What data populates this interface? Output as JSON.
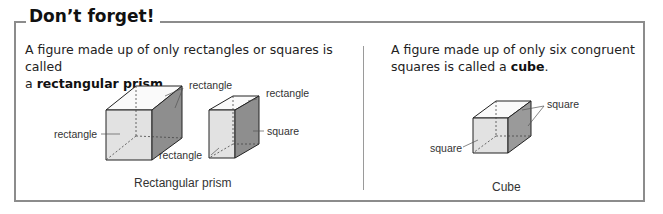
{
  "box": {
    "title": "Don’t forget!"
  },
  "left_panel": {
    "text_before": "A figure made up of only rectangles or squares is called",
    "text_line2_prefix": "a ",
    "term": "rectangular prism",
    "text_suffix": ".",
    "labels": {
      "large_top": "rectangle",
      "large_front": "rectangle",
      "small_top": "rectangle",
      "small_side": "square",
      "small_front": "rectangle"
    },
    "caption": "Rectangular prism"
  },
  "right_panel": {
    "text_line1": "A figure made up of only six congruent",
    "text_line2_prefix": "squares is called a ",
    "term": "cube",
    "text_suffix": ".",
    "labels": {
      "top_side": "square",
      "front": "square"
    },
    "caption": "Cube"
  },
  "colors": {
    "border": "#8c8c8c",
    "face_light": "#e2e2e2",
    "face_dark": "#8a8a8a",
    "face_top": "#ffffff",
    "edge": "#222222"
  }
}
